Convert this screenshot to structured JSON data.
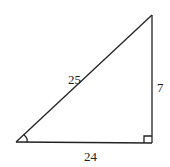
{
  "diagram": {
    "type": "right-triangle",
    "stroke_color": "#222222",
    "labels": {
      "hypotenuse": "25",
      "vertical_leg": "7",
      "horizontal_leg": "24"
    },
    "markers": {
      "right_angle": "bottom-right",
      "angle_arc": "bottom-left"
    }
  }
}
